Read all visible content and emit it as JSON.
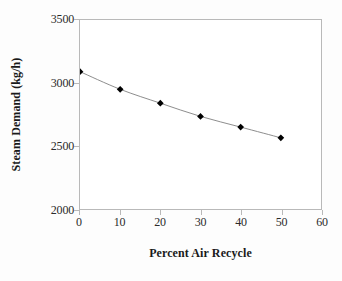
{
  "chart_data": {
    "type": "line",
    "title": "",
    "subtitle": "",
    "xlabel": "Percent Air Recycle",
    "ylabel": "Steam Demand (kg/h)",
    "xlim": [
      0,
      60
    ],
    "ylim": [
      2000,
      3500
    ],
    "xticks": [
      0,
      10,
      20,
      30,
      40,
      50,
      60
    ],
    "yticks": [
      2000,
      2500,
      3000,
      3500
    ],
    "xtick_labels": [
      "0",
      "10",
      "20",
      "30",
      "40",
      "50",
      "60"
    ],
    "ytick_labels": [
      "2000",
      "2500",
      "3000",
      "3500"
    ],
    "grid": false,
    "legend": false,
    "legend_position": "none",
    "marker": "diamond",
    "marker_color": "#000000",
    "line_color": "#808080",
    "axis_color": "#b9b9b9",
    "plot_background": "#ffffff",
    "x": [
      0,
      10,
      20,
      30,
      40,
      50
    ],
    "series": [
      {
        "name": "Steam Demand",
        "values": [
          3090,
          2950,
          2840,
          2735,
          2650,
          2565
        ]
      }
    ],
    "points": [
      {
        "x": 0,
        "y": 3090
      },
      {
        "x": 10,
        "y": 2950
      },
      {
        "x": 20,
        "y": 2840
      },
      {
        "x": 30,
        "y": 2735
      },
      {
        "x": 40,
        "y": 2650
      },
      {
        "x": 50,
        "y": 2565
      }
    ]
  }
}
